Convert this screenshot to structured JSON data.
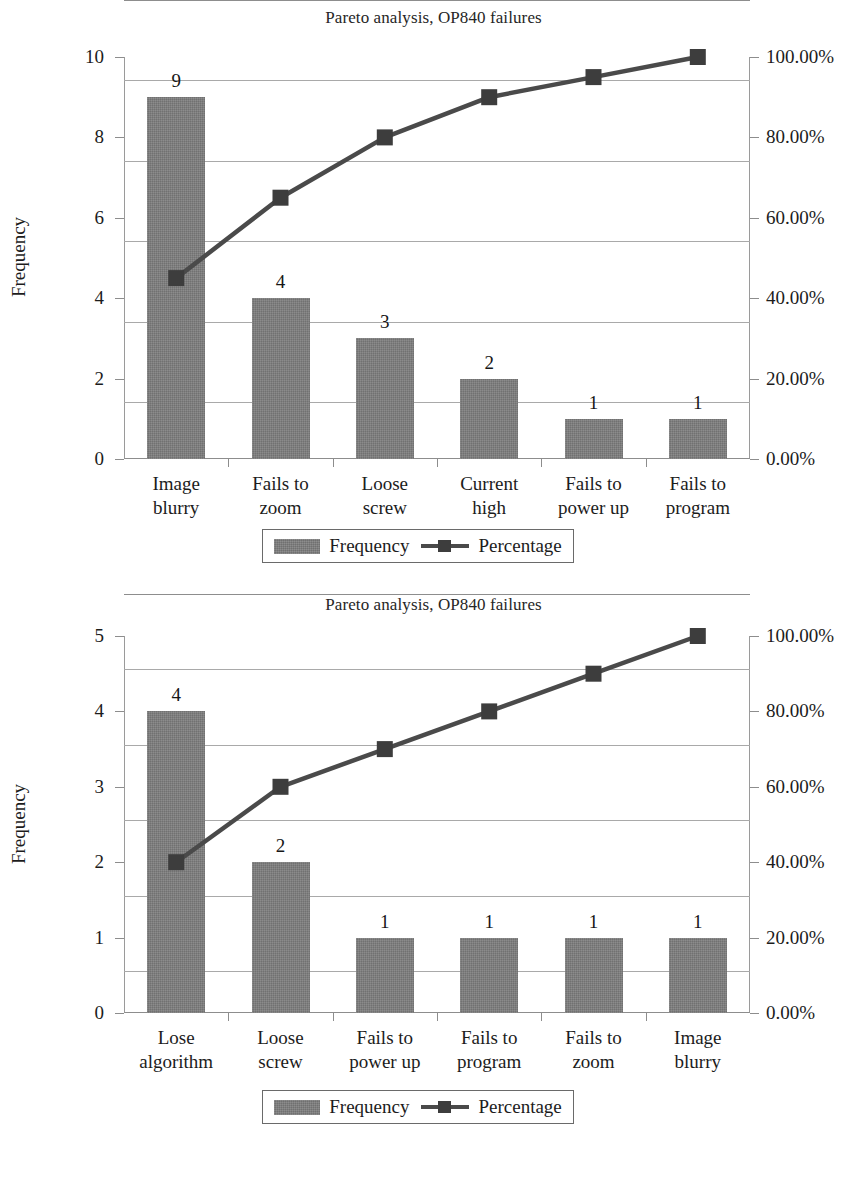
{
  "page": {
    "background": "#ffffff",
    "bar_color": "#7e7e7e",
    "line_color": "#4a4a4a",
    "marker_color": "#3d3d3d",
    "grid_color": "#a9a9a9",
    "axis_color": "#8d8d8d"
  },
  "legend": {
    "frequency_label": "Frequency",
    "percentage_label": "Percentage"
  },
  "charts": [
    {
      "id": "chart-1",
      "title": "Pareto analysis, OP840 failures",
      "ylabel": "Frequency",
      "left_ticks": [
        "0",
        "2",
        "4",
        "6",
        "8",
        "10"
      ],
      "right_ticks": [
        "0.00%",
        "20.00%",
        "40.00%",
        "60.00%",
        "80.00%",
        "100.00%"
      ],
      "categories": [
        [
          "Image",
          "blurry"
        ],
        [
          "Fails to",
          "zoom"
        ],
        [
          "Loose",
          "screw"
        ],
        [
          "Current",
          "high"
        ],
        [
          "Fails to",
          "power up"
        ],
        [
          "Fails to",
          "program"
        ]
      ],
      "bar_labels": [
        "9",
        "4",
        "3",
        "2",
        "1",
        "1"
      ]
    },
    {
      "id": "chart-2",
      "title": "Pareto analysis, OP840 failures",
      "ylabel": "Frequency",
      "left_ticks": [
        "0",
        "1",
        "2",
        "3",
        "4",
        "5"
      ],
      "right_ticks": [
        "0.00%",
        "20.00%",
        "40.00%",
        "60.00%",
        "80.00%",
        "100.00%"
      ],
      "categories": [
        [
          "Lose",
          "algorithm"
        ],
        [
          "Loose",
          "screw"
        ],
        [
          "Fails to",
          "power up"
        ],
        [
          "Fails to",
          "program"
        ],
        [
          "Fails to",
          "zoom"
        ],
        [
          "Image",
          "blurry"
        ]
      ],
      "bar_labels": [
        "4",
        "2",
        "1",
        "1",
        "1",
        "1"
      ]
    }
  ],
  "chart_data": [
    {
      "type": "bar",
      "title": "Pareto analysis, OP840 failures",
      "xlabel": "",
      "ylabel": "Frequency",
      "y2label": "",
      "categories": [
        "Image blurry",
        "Fails to zoom",
        "Loose screw",
        "Current high",
        "Fails to power up",
        "Fails to program"
      ],
      "series": [
        {
          "name": "Frequency",
          "type": "bar",
          "axis": "left",
          "values": [
            9,
            4,
            3,
            2,
            1,
            1
          ]
        },
        {
          "name": "Percentage",
          "type": "line",
          "axis": "right",
          "values": [
            45.0,
            65.0,
            80.0,
            90.0,
            95.0,
            100.0
          ],
          "value_labels": [
            "45.00%",
            "65.00%",
            "80.00%",
            "90.00%",
            "95.00%",
            "100.00%"
          ]
        }
      ],
      "ylim": [
        0,
        10
      ],
      "yticks": [
        0,
        2,
        4,
        6,
        8,
        10
      ],
      "ytick_labels": [
        "0",
        "2",
        "4",
        "6",
        "8",
        "10"
      ],
      "y2lim": [
        0,
        100
      ],
      "y2ticks": [
        0,
        20,
        40,
        60,
        80,
        100
      ],
      "y2tick_labels": [
        "0.00%",
        "20.00%",
        "40.00%",
        "60.00%",
        "80.00%",
        "100.00%"
      ],
      "data_labels": [
        "9",
        "4",
        "3",
        "2",
        "1",
        "1"
      ],
      "total": 20,
      "grid": true,
      "legend": [
        "Frequency",
        "Percentage"
      ],
      "legend_position": "bottom"
    },
    {
      "type": "bar",
      "title": "Pareto analysis, OP840 failures",
      "xlabel": "",
      "ylabel": "Frequency",
      "y2label": "",
      "categories": [
        "Lose algorithm",
        "Loose screw",
        "Fails to power up",
        "Fails to program",
        "Fails to zoom",
        "Image blurry"
      ],
      "series": [
        {
          "name": "Frequency",
          "type": "bar",
          "axis": "left",
          "values": [
            4,
            2,
            1,
            1,
            1,
            1
          ]
        },
        {
          "name": "Percentage",
          "type": "line",
          "axis": "right",
          "values": [
            40.0,
            60.0,
            70.0,
            80.0,
            90.0,
            100.0
          ],
          "value_labels": [
            "40.00%",
            "60.00%",
            "70.00%",
            "80.00%",
            "90.00%",
            "100.00%"
          ]
        }
      ],
      "ylim": [
        0,
        5
      ],
      "yticks": [
        0,
        1,
        2,
        3,
        4,
        5
      ],
      "ytick_labels": [
        "0",
        "1",
        "2",
        "3",
        "4",
        "5"
      ],
      "y2lim": [
        0,
        100
      ],
      "y2ticks": [
        0,
        20,
        40,
        60,
        80,
        100
      ],
      "y2tick_labels": [
        "0.00%",
        "20.00%",
        "40.00%",
        "60.00%",
        "80.00%",
        "100.00%"
      ],
      "data_labels": [
        "4",
        "2",
        "1",
        "1",
        "1",
        "1"
      ],
      "total": 10,
      "grid": true,
      "legend": [
        "Frequency",
        "Percentage"
      ],
      "legend_position": "bottom"
    }
  ]
}
